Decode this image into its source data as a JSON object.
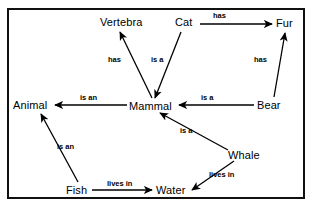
{
  "diagram": {
    "type": "semantic-network",
    "frame": {
      "stroke": "#111111",
      "background": "#ffffff"
    },
    "nodes": [
      {
        "id": "vertebra",
        "label": "Vertebra",
        "x": 100,
        "y": 16
      },
      {
        "id": "cat",
        "label": "Cat",
        "x": 175,
        "y": 16
      },
      {
        "id": "fur",
        "label": "Fur",
        "x": 276,
        "y": 17
      },
      {
        "id": "animal",
        "label": "Animal",
        "x": 13,
        "y": 99
      },
      {
        "id": "mammal",
        "label": "Mammal",
        "x": 129,
        "y": 100
      },
      {
        "id": "bear",
        "label": "Bear",
        "x": 257,
        "y": 99
      },
      {
        "id": "whale",
        "label": "Whale",
        "x": 228,
        "y": 149
      },
      {
        "id": "fish",
        "label": "Fish",
        "x": 66,
        "y": 184
      },
      {
        "id": "water",
        "label": "Water",
        "x": 156,
        "y": 184
      }
    ],
    "edges": [
      {
        "id": "mammal-has-vertebra",
        "from": "mammal",
        "to": "vertebra",
        "label": "has",
        "label_x": 108,
        "label_y": 55,
        "x1": 152,
        "y1": 98,
        "x2": 120,
        "y2": 32
      },
      {
        "id": "cat-isa-mammal",
        "from": "cat",
        "to": "mammal",
        "label": "is a",
        "label_x": 151,
        "label_y": 55,
        "x1": 181,
        "y1": 32,
        "x2": 155,
        "y2": 98
      },
      {
        "id": "cat-has-fur",
        "from": "cat",
        "to": "fur",
        "label": "has",
        "label_x": 213,
        "label_y": 11,
        "x1": 200,
        "y1": 24,
        "x2": 272,
        "y2": 24
      },
      {
        "id": "bear-has-fur",
        "from": "bear",
        "to": "fur",
        "label": "has",
        "label_x": 254,
        "label_y": 55,
        "x1": 274,
        "y1": 97,
        "x2": 285,
        "y2": 33
      },
      {
        "id": "bear-isa-mammal",
        "from": "bear",
        "to": "mammal",
        "label": "is a",
        "label_x": 201,
        "label_y": 93,
        "x1": 254,
        "y1": 105,
        "x2": 179,
        "y2": 105
      },
      {
        "id": "mammal-isan-animal",
        "from": "mammal",
        "to": "animal",
        "label": "is an",
        "label_x": 80,
        "label_y": 93,
        "x1": 127,
        "y1": 105,
        "x2": 55,
        "y2": 105
      },
      {
        "id": "whale-isa-mammal",
        "from": "whale",
        "to": "mammal",
        "label": "is a",
        "label_x": 180,
        "label_y": 126,
        "x1": 228,
        "y1": 150,
        "x2": 160,
        "y2": 113
      },
      {
        "id": "whale-livesin-water",
        "from": "whale",
        "to": "water",
        "label": "lives in",
        "label_x": 209,
        "label_y": 170,
        "x1": 234,
        "y1": 161,
        "x2": 192,
        "y2": 190
      },
      {
        "id": "fish-isan-animal",
        "from": "fish",
        "to": "animal",
        "label": "is an",
        "label_x": 57,
        "label_y": 142,
        "x1": 78,
        "y1": 182,
        "x2": 41,
        "y2": 114
      },
      {
        "id": "fish-livesin-water",
        "from": "fish",
        "to": "water",
        "label": "lives in",
        "label_x": 107,
        "label_y": 179,
        "x1": 92,
        "y1": 190,
        "x2": 152,
        "y2": 190
      }
    ]
  }
}
